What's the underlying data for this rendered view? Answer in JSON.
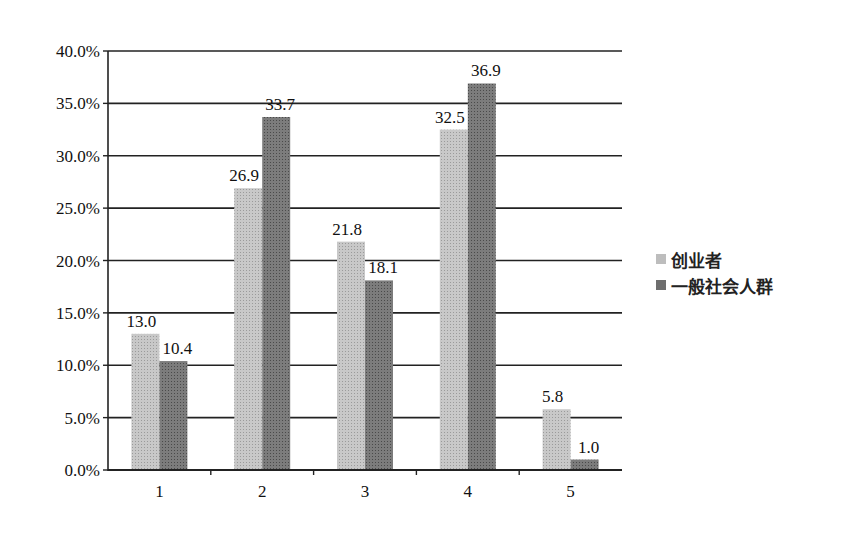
{
  "chart_data": {
    "type": "bar",
    "title": "",
    "xlabel": "",
    "ylabel": "",
    "categories": [
      "1",
      "2",
      "3",
      "4",
      "5"
    ],
    "series": [
      {
        "name": "创业者",
        "values": [
          13.0,
          26.9,
          21.8,
          32.5,
          5.8
        ],
        "color": "#bdbdbd"
      },
      {
        "name": "一般社会人群",
        "values": [
          10.4,
          33.7,
          18.1,
          36.9,
          1.0
        ],
        "color": "#7a7a7a"
      }
    ],
    "ylim": [
      0,
      40
    ],
    "yticks": [
      "0.0%",
      "5.0%",
      "10.0%",
      "15.0%",
      "20.0%",
      "25.0%",
      "30.0%",
      "35.0%",
      "40.0%"
    ],
    "grid": true,
    "legend_position": "right",
    "data_labels": true
  },
  "legend": {
    "items": [
      {
        "label": "创业者"
      },
      {
        "label": "一般社会人群"
      }
    ]
  }
}
